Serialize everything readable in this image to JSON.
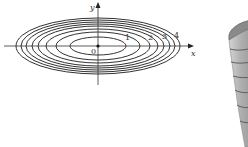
{
  "contour_plot": {
    "axes": {
      "x_label": "x",
      "y_label": "y",
      "origin_label": "0"
    },
    "level_labels": [
      "1",
      "2",
      "3",
      "4"
    ],
    "ellipse_count": 8,
    "line_color": "#333333"
  },
  "surface_plot": {
    "type": "paraboloid",
    "fill_color": "#b8b8b8",
    "rim_color": "#7a7a7a",
    "contour_line_color": "#555555"
  }
}
